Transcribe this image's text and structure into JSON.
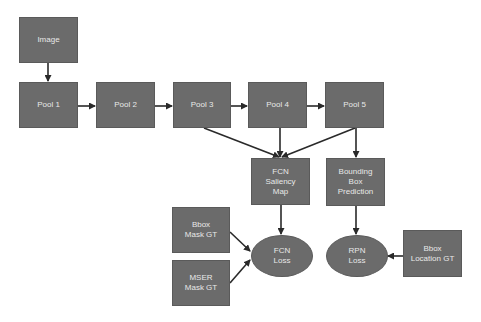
{
  "diagram": {
    "colors": {
      "node_fill": "#6b6b6b",
      "node_text": "#e8e8e8",
      "arrow": "#2a2a2a",
      "background": "#ffffff"
    },
    "nodes": {
      "image": "Image",
      "pool1": "Pool 1",
      "pool2": "Pool 2",
      "pool3": "Pool 3",
      "pool4": "Pool 4",
      "pool5": "Pool 5",
      "fcn_saliency_map": "FCN\nSaliency\nMap",
      "bounding_box_prediction": "Bounding\nBox\nPrediction",
      "bbox_mask_gt": "Bbox\nMask GT",
      "mser_mask_gt": "MSER\nMask GT",
      "fcn_loss": "FCN\nLoss",
      "rpn_loss": "RPN\nLoss",
      "bbox_location_gt": "Bbox\nLocation GT"
    },
    "edges": [
      [
        "Image",
        "Pool 1"
      ],
      [
        "Pool 1",
        "Pool 2"
      ],
      [
        "Pool 2",
        "Pool 3"
      ],
      [
        "Pool 3",
        "Pool 4"
      ],
      [
        "Pool 4",
        "Pool 5"
      ],
      [
        "Pool 3",
        "FCN Saliency Map"
      ],
      [
        "Pool 4",
        "FCN Saliency Map"
      ],
      [
        "Pool 5",
        "FCN Saliency Map"
      ],
      [
        "Pool 5",
        "Bounding Box Prediction"
      ],
      [
        "FCN Saliency Map",
        "FCN Loss"
      ],
      [
        "Bbox Mask GT",
        "FCN Loss"
      ],
      [
        "MSER Mask GT",
        "FCN Loss"
      ],
      [
        "Bounding Box Prediction",
        "RPN Loss"
      ],
      [
        "Bbox Location GT",
        "RPN Loss"
      ]
    ]
  }
}
